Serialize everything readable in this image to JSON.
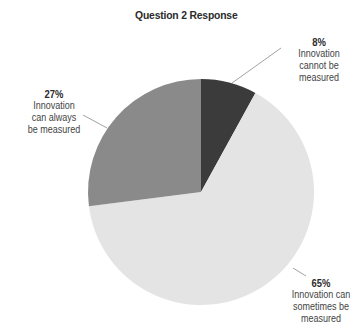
{
  "chart_data": {
    "type": "pie",
    "title": "Question 2 Response",
    "slices": [
      {
        "label": "Innovation cannot be measured",
        "value": 8,
        "display": "8%",
        "color": "#3b3b3b"
      },
      {
        "label": "Innovation can sometimes be measured",
        "value": 65,
        "display": "65%",
        "color": "#e4e4e4"
      },
      {
        "label": "Innovation can always be measured",
        "value": 27,
        "display": "27%",
        "color": "#8a8a8a"
      }
    ],
    "start_angle": "12 o'clock, clockwise",
    "legend": "none (callout labels)"
  },
  "title": "Question 2 Response",
  "labels": {
    "cannot": {
      "pct": "8%",
      "text": "Innovation\ncannot be\nmeasured"
    },
    "sometimes": {
      "pct": "65%",
      "text": "Innovation can\nsometimes be\nmeasured"
    },
    "always": {
      "pct": "27%",
      "text": "Innovation\ncan always\nbe measured"
    }
  }
}
